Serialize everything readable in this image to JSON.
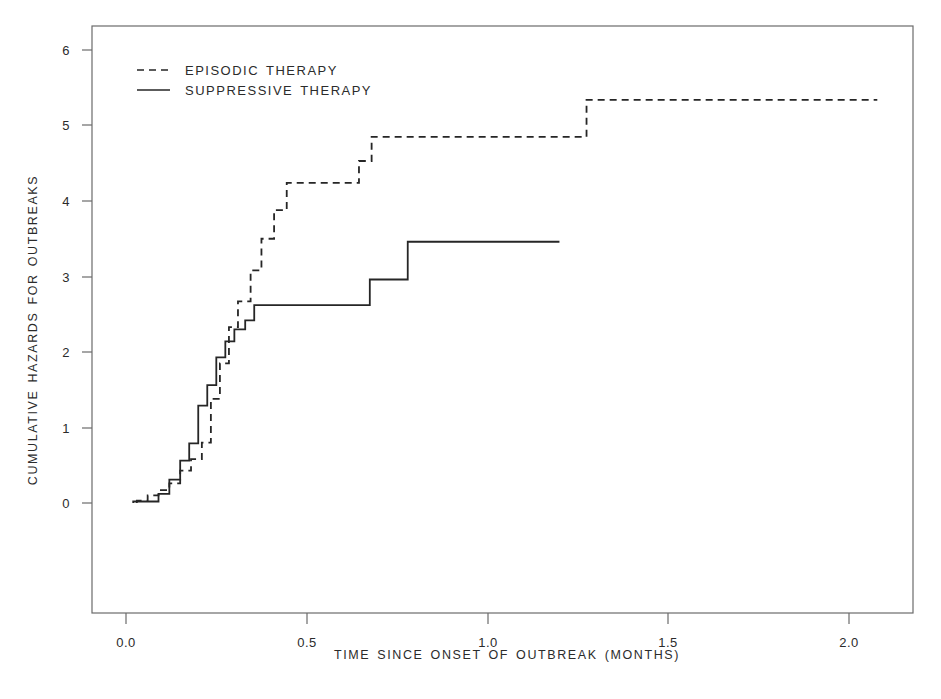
{
  "chart_data": {
    "type": "line",
    "title": "",
    "subtitle": "",
    "xlabel": "TIME SINCE ONSET OF OUTBREAK (MONTHS)",
    "ylabel": "CUMULATIVE HAZARDS FOR OUTBREAKS",
    "xlim": [
      -0.07,
      2.18
    ],
    "ylim": [
      -0.35,
      6.35
    ],
    "xticks": [
      0.0,
      0.5,
      1.0,
      1.5,
      2.0
    ],
    "xtick_labels": [
      "0.0",
      "0.5",
      "1.0",
      "1.5",
      "2.0"
    ],
    "yticks": [
      0,
      1,
      2,
      3,
      4,
      5,
      6
    ],
    "ytick_labels": [
      "0",
      "1",
      "2",
      "3",
      "4",
      "5",
      "6"
    ],
    "grid": false,
    "legend_position": "upper-left",
    "line_color": "#262626",
    "axis_color": "#4d4d4d",
    "interpolation": "step-post",
    "series": [
      {
        "name": "EPISODIC THERAPY",
        "style": "dashed",
        "x": [
          0.03,
          0.06,
          0.09,
          0.12,
          0.15,
          0.18,
          0.21,
          0.235,
          0.26,
          0.285,
          0.31,
          0.345,
          0.375,
          0.41,
          0.445,
          0.615,
          0.645,
          0.68,
          1.275,
          2.08
        ],
        "y": [
          0.03,
          0.1,
          0.17,
          0.26,
          0.43,
          0.58,
          0.8,
          1.38,
          1.85,
          2.33,
          2.67,
          3.08,
          3.5,
          3.88,
          4.24,
          4.24,
          4.53,
          4.85,
          5.34,
          5.34
        ],
        "x_end": 2.08,
        "y_final": 5.34
      },
      {
        "name": "SUPPRESSIVE THERAPY",
        "style": "solid",
        "x": [
          0.02,
          0.06,
          0.09,
          0.12,
          0.15,
          0.175,
          0.2,
          0.225,
          0.25,
          0.275,
          0.3,
          0.33,
          0.355,
          0.42,
          0.675,
          0.78,
          1.2
        ],
        "y": [
          0.02,
          0.02,
          0.12,
          0.31,
          0.56,
          0.79,
          1.29,
          1.56,
          1.93,
          2.14,
          2.3,
          2.42,
          2.62,
          2.62,
          2.96,
          3.46,
          3.46
        ],
        "x_end": 1.2,
        "y_final": 3.46
      }
    ]
  },
  "legend": {
    "items": [
      {
        "label": "EPISODIC THERAPY",
        "style": "dashed"
      },
      {
        "label": "SUPPRESSIVE THERAPY",
        "style": "solid"
      }
    ]
  },
  "axes": {
    "x_title": "TIME SINCE ONSET OF OUTBREAK (MONTHS)",
    "y_title": "CUMULATIVE HAZARDS FOR OUTBREAKS",
    "x_ticks": [
      "0.0",
      "0.5",
      "1.0",
      "1.5",
      "2.0"
    ],
    "y_ticks": [
      "6",
      "5",
      "4",
      "3",
      "2",
      "1",
      "0"
    ]
  }
}
